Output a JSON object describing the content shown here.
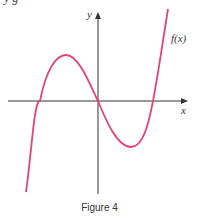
{
  "header": {
    "cutoff_text": "y  g"
  },
  "axes": {
    "x_label": "x",
    "y_label": "y"
  },
  "curve": {
    "label": "f(x)",
    "color": "#e0457a"
  },
  "caption": "Figure 4"
}
